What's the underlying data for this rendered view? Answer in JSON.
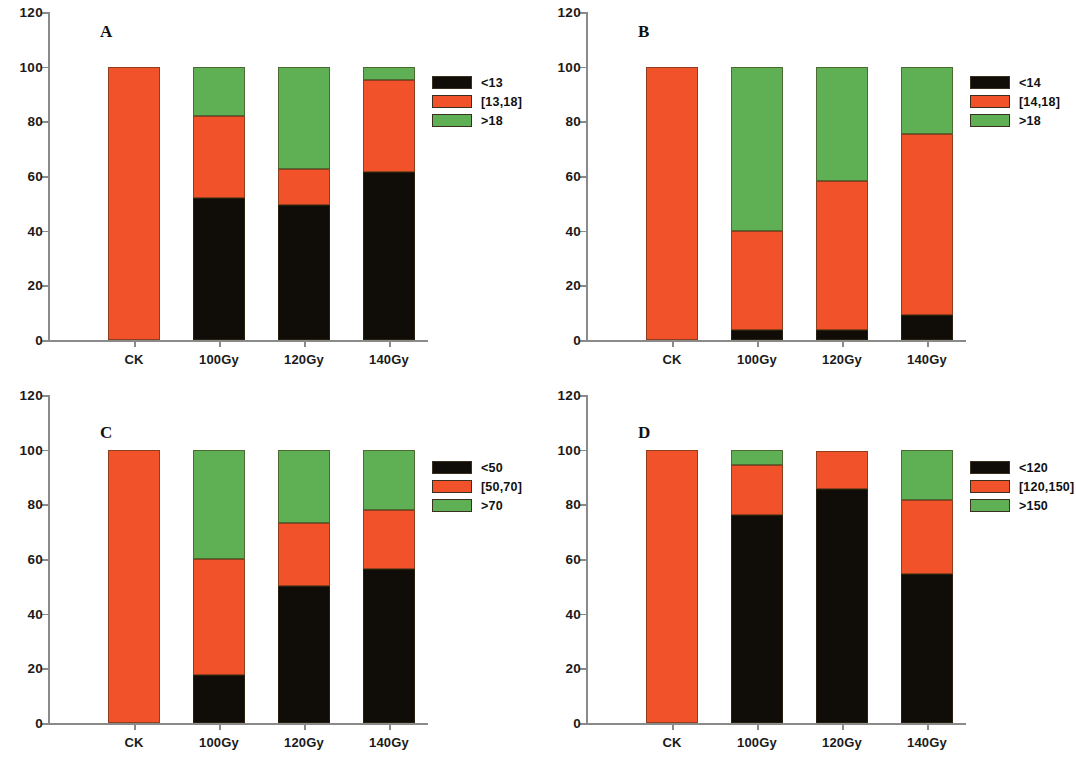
{
  "figure": {
    "background": "#ffffff",
    "panel_count": 4
  },
  "colors": {
    "black": "#100d09",
    "red": "#f2522a",
    "green": "#5fb055",
    "axis": "#8a8a8a",
    "text": "#1a1a1a"
  },
  "axis": {
    "y_ticks": [
      "0",
      "20",
      "40",
      "60",
      "80",
      "100",
      "120"
    ],
    "y_tick_values": [
      0,
      20,
      40,
      60,
      80,
      100,
      120
    ],
    "x_ticks": [
      "CK",
      "100Gy",
      "120Gy",
      "140Gy"
    ]
  },
  "panels": {
    "A": {
      "letter": "A",
      "legend": [
        "<13",
        "[13,18]",
        ">18"
      ]
    },
    "B": {
      "letter": "B",
      "legend": [
        "<14",
        "[14,18]",
        ">18"
      ]
    },
    "C": {
      "letter": "C",
      "legend": [
        "<50",
        "[50,70]",
        ">70"
      ]
    },
    "D": {
      "letter": "D",
      "legend": [
        "<120",
        "[120,150]",
        ">150"
      ]
    }
  },
  "chart_data": [
    {
      "type": "bar",
      "stacked": true,
      "title": "A",
      "xlabel": "",
      "ylabel": "",
      "ylim": [
        0,
        120
      ],
      "yticks": [
        0,
        20,
        40,
        60,
        80,
        100,
        120
      ],
      "grid": false,
      "legend_position": "right",
      "categories": [
        "CK",
        "100Gy",
        "120Gy",
        "140Gy"
      ],
      "series": [
        {
          "name": "<13",
          "color": "#100d09",
          "values": [
            0,
            52,
            49.5,
            61.5
          ]
        },
        {
          "name": "[13,18]",
          "color": "#f2522a",
          "values": [
            100,
            30,
            13,
            33.5
          ]
        },
        {
          "name": ">18",
          "color": "#5fb055",
          "values": [
            0,
            18,
            37.5,
            5
          ]
        }
      ]
    },
    {
      "type": "bar",
      "stacked": true,
      "title": "B",
      "xlabel": "",
      "ylabel": "",
      "ylim": [
        0,
        120
      ],
      "yticks": [
        0,
        20,
        40,
        60,
        80,
        100,
        120
      ],
      "grid": false,
      "legend_position": "right",
      "categories": [
        "CK",
        "100Gy",
        "120Gy",
        "140Gy"
      ],
      "series": [
        {
          "name": "<14",
          "color": "#100d09",
          "values": [
            0,
            3.5,
            3.5,
            9
          ]
        },
        {
          "name": "[14,18]",
          "color": "#f2522a",
          "values": [
            100,
            36.5,
            54.5,
            66.5
          ]
        },
        {
          "name": ">18",
          "color": "#5fb055",
          "values": [
            0,
            60,
            42,
            24.5
          ]
        }
      ]
    },
    {
      "type": "bar",
      "stacked": true,
      "title": "C",
      "xlabel": "",
      "ylabel": "",
      "ylim": [
        0,
        120
      ],
      "yticks": [
        0,
        20,
        40,
        60,
        80,
        100,
        120
      ],
      "grid": false,
      "legend_position": "right",
      "categories": [
        "CK",
        "100Gy",
        "120Gy",
        "140Gy"
      ],
      "series": [
        {
          "name": "<50",
          "color": "#100d09",
          "values": [
            0,
            17.5,
            50,
            56.5
          ]
        },
        {
          "name": "[50,70]",
          "color": "#f2522a",
          "values": [
            100,
            42.5,
            23,
            21.5
          ]
        },
        {
          "name": ">70",
          "color": "#5fb055",
          "values": [
            0,
            40,
            27,
            22
          ]
        }
      ]
    },
    {
      "type": "bar",
      "stacked": true,
      "title": "D",
      "xlabel": "",
      "ylabel": "",
      "ylim": [
        0,
        120
      ],
      "yticks": [
        0,
        20,
        40,
        60,
        80,
        100,
        120
      ],
      "grid": false,
      "legend_position": "right",
      "categories": [
        "CK",
        "100Gy",
        "120Gy",
        "140Gy"
      ],
      "series": [
        {
          "name": "<120",
          "color": "#100d09",
          "values": [
            0,
            76,
            85.5,
            54.5
          ]
        },
        {
          "name": "[120,150]",
          "color": "#f2522a",
          "values": [
            100,
            18.5,
            14,
            27
          ]
        },
        {
          "name": ">150",
          "color": "#5fb055",
          "values": [
            0,
            5.5,
            0,
            18.5
          ]
        }
      ]
    }
  ]
}
